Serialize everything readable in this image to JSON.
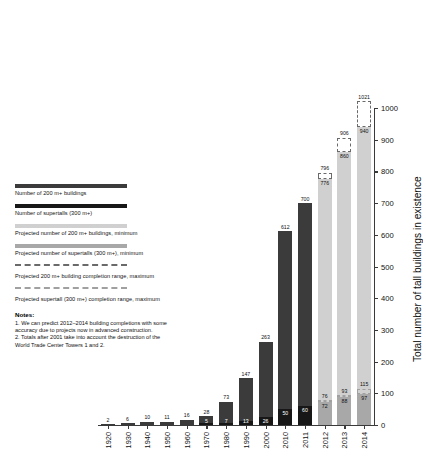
{
  "legend": {
    "items": [
      {
        "label": "Number of 200 m+ buildings",
        "style": "solid-dark",
        "color": "#3b3b3b"
      },
      {
        "label": "Number of supertalls (300 m+)",
        "style": "solid-black",
        "color": "#171717"
      },
      {
        "label": "Projected number of 200 m+ buildings, minimum",
        "style": "solid-light",
        "color": "#d0d0d0"
      },
      {
        "label": "Projected number of supertalls (300 m+), minimum",
        "style": "solid-midlight",
        "color": "#a8a8a8"
      },
      {
        "label": "Projected 200 m+ building completion range, maximum",
        "style": "dashed-dark",
        "color": "#6a6a6a"
      },
      {
        "label": "Projected supertall (300 m+) completion range, maximum",
        "style": "dashed-light",
        "color": "#a0a0a0"
      }
    ]
  },
  "notes": {
    "title": "Notes:",
    "lines": [
      "1. We can predict 2012–2014 building completions with some",
      "accuracy due to projects now in advanced construction.",
      "2. Totals after 2001 take into account the destruction of the",
      "World Trade Center Towers 1 and 2."
    ]
  },
  "chart_data": {
    "type": "bar",
    "title": "",
    "xlabel": "",
    "ylabel": "Total number of tall buildings in existence",
    "ylim": [
      0,
      1000
    ],
    "yticks": [
      0,
      100,
      200,
      300,
      400,
      500,
      600,
      700,
      800,
      900,
      1000
    ],
    "grid": false,
    "legend_position": "left",
    "categories": [
      "1920",
      "1930",
      "1940",
      "1950",
      "1960",
      "1970",
      "1980",
      "1990",
      "2000",
      "2010",
      "2011",
      "2012",
      "2013",
      "2014"
    ],
    "series": [
      {
        "name": "Number of 200 m+ buildings",
        "key": "total",
        "values": [
          2,
          6,
          10,
          11,
          16,
          28,
          73,
          147,
          263,
          612,
          700,
          776,
          860,
          940
        ]
      },
      {
        "name": "Number of supertalls (300 m+)",
        "key": "supertall",
        "values": [
          null,
          null,
          null,
          null,
          null,
          5,
          7,
          13,
          26,
          50,
          60,
          72,
          88,
          97
        ]
      },
      {
        "name": "Projected 200 m+ building completion range, maximum",
        "key": "total_max",
        "values": [
          null,
          null,
          null,
          null,
          null,
          null,
          null,
          null,
          null,
          null,
          null,
          796,
          906,
          1021
        ]
      },
      {
        "name": "Projected supertall (300 m+) completion range, maximum",
        "key": "supertall_max",
        "values": [
          null,
          null,
          null,
          null,
          null,
          null,
          null,
          null,
          null,
          null,
          null,
          76,
          93,
          115
        ]
      }
    ],
    "projected_from": "2012"
  }
}
